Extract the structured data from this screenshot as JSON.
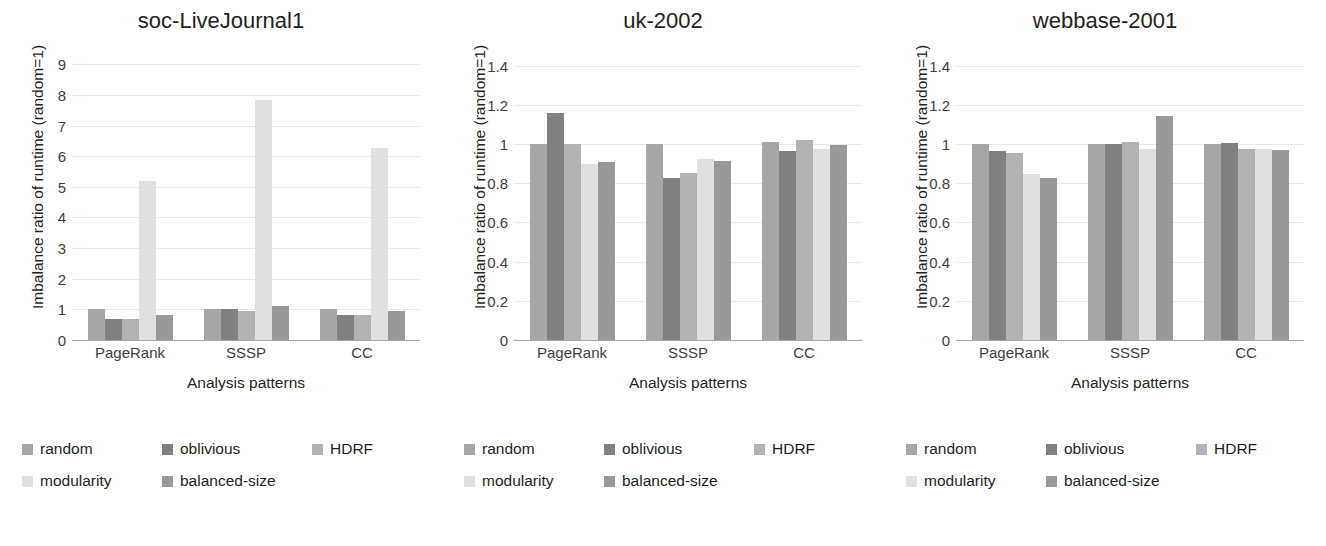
{
  "figure": {
    "panel_count": 3,
    "series_names": [
      "random",
      "oblivious",
      "HDRF",
      "modularity",
      "balanced-size"
    ],
    "series_colors": [
      "#a6a6a6",
      "#808080",
      "#b3b3b3",
      "#e0e0e0",
      "#999999"
    ],
    "xlabel": "Analysis patterns",
    "ylabel": "Imbalance ratio of runtime (random=1)",
    "categories": [
      "PageRank",
      "SSSP",
      "CC"
    ]
  },
  "legend": {
    "row1": [
      {
        "label": "random",
        "color": "#a6a6a6"
      },
      {
        "label": "oblivious",
        "color": "#808080"
      },
      {
        "label": "HDRF",
        "color": "#b3b3b3"
      }
    ],
    "row2": [
      {
        "label": "modularity",
        "color": "#e0e0e0"
      },
      {
        "label": "balanced-size",
        "color": "#999999"
      }
    ]
  },
  "chart_data": [
    {
      "type": "bar",
      "title": "soc-LiveJournal1",
      "xlabel": "Analysis patterns",
      "ylabel": "Imbalance ratio of runtime (random=1)",
      "categories": [
        "PageRank",
        "SSSP",
        "CC"
      ],
      "yticks": [
        0,
        1,
        2,
        3,
        4,
        5,
        6,
        7,
        8,
        9
      ],
      "ylim": [
        0,
        9.4
      ],
      "grid": true,
      "legend_position": "below",
      "series": [
        {
          "name": "random",
          "values": [
            1.0,
            1.0,
            1.0
          ]
        },
        {
          "name": "oblivious",
          "values": [
            0.67,
            1.02,
            0.83
          ]
        },
        {
          "name": "HDRF",
          "values": [
            0.67,
            0.95,
            0.82
          ]
        },
        {
          "name": "modularity",
          "values": [
            5.18,
            7.82,
            6.27
          ]
        },
        {
          "name": "balanced-size",
          "values": [
            0.82,
            1.1,
            0.95
          ]
        }
      ]
    },
    {
      "type": "bar",
      "title": "uk-2002",
      "xlabel": "Analysis patterns",
      "ylabel": "Imbalance ratio of runtime (random=1)",
      "categories": [
        "PageRank",
        "SSSP",
        "CC"
      ],
      "yticks": [
        0,
        0.2,
        0.4,
        0.6,
        0.8,
        1,
        1.2,
        1.4
      ],
      "ylim": [
        0,
        1.47
      ],
      "grid": true,
      "legend_position": "below",
      "series": [
        {
          "name": "random",
          "values": [
            1.0,
            1.0,
            1.01
          ]
        },
        {
          "name": "oblivious",
          "values": [
            1.16,
            0.825,
            0.965
          ]
        },
        {
          "name": "HDRF",
          "values": [
            1.0,
            0.855,
            1.02
          ]
        },
        {
          "name": "modularity",
          "values": [
            0.9,
            0.925,
            0.975
          ]
        },
        {
          "name": "balanced-size",
          "values": [
            0.91,
            0.915,
            0.995
          ]
        }
      ]
    },
    {
      "type": "bar",
      "title": "webbase-2001",
      "xlabel": "Analysis patterns",
      "ylabel": "Imbalance ratio of runtime (random=1)",
      "categories": [
        "PageRank",
        "SSSP",
        "CC"
      ],
      "yticks": [
        0,
        0.2,
        0.4,
        0.6,
        0.8,
        1,
        1.2,
        1.4
      ],
      "ylim": [
        0,
        1.47
      ],
      "grid": true,
      "legend_position": "below",
      "series": [
        {
          "name": "random",
          "values": [
            1.0,
            1.0,
            1.0
          ]
        },
        {
          "name": "oblivious",
          "values": [
            0.965,
            1.0,
            1.005
          ]
        },
        {
          "name": "HDRF",
          "values": [
            0.955,
            1.01,
            0.975
          ]
        },
        {
          "name": "modularity",
          "values": [
            0.845,
            0.975,
            0.975
          ]
        },
        {
          "name": "balanced-size",
          "values": [
            0.825,
            1.145,
            0.97
          ]
        }
      ]
    }
  ]
}
